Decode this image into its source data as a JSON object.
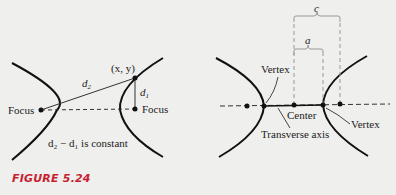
{
  "figure": {
    "caption": "FIGURE 5.24",
    "caption_color": "#c8202f"
  },
  "left_diagram": {
    "point_label": "(x, y)",
    "d2_label": "d",
    "d2_sub": "2",
    "d1_label": "d",
    "d1_sub": "1",
    "focus_left": "Focus",
    "focus_right": "Focus",
    "equation": "d₂ − d₁ is constant"
  },
  "right_diagram": {
    "c_label": "c",
    "a_label": "a",
    "vertex_left": "Vertex",
    "vertex_right": "Vertex",
    "center": "Center",
    "transverse_axis": "Transverse axis"
  }
}
